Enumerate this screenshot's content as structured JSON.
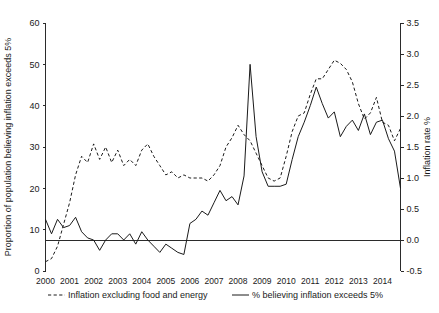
{
  "chart_data": {
    "type": "line",
    "title": "",
    "xlabel": "",
    "ylabel": "Proportion of population believing inflation exceeds 5%",
    "y2label": "Inflation rate %",
    "xlim": [
      2000.0,
      2014.75
    ],
    "ylim": [
      0,
      60
    ],
    "y2lim": [
      -0.5,
      3.5
    ],
    "grid": false,
    "legend_position": "below",
    "x_tick_labels": [
      "2000",
      "2001",
      "2002",
      "2003",
      "2004",
      "2005",
      "2006",
      "2007",
      "2008",
      "2009",
      "2010",
      "2011",
      "2012",
      "2013",
      "2014"
    ],
    "x_tick_values": [
      2000,
      2001,
      2002,
      2003,
      2004,
      2005,
      2006,
      2007,
      2008,
      2009,
      2010,
      2011,
      2012,
      2013,
      2014
    ],
    "y_tick_labels": [
      "0",
      "10",
      "20",
      "30",
      "40",
      "50",
      "60"
    ],
    "y_tick_values": [
      0,
      10,
      20,
      30,
      40,
      50,
      60
    ],
    "y2_tick_labels": [
      "-0.5",
      "0.0",
      "0.5",
      "1.0",
      "1.5",
      "2.0",
      "2.5",
      "3.0",
      "3.5"
    ],
    "y2_tick_values": [
      -0.5,
      0.0,
      0.5,
      1.0,
      1.5,
      2.0,
      2.5,
      3.0,
      3.5
    ],
    "series": [
      {
        "name": "Inflation excluding food and energy",
        "style": "dashed",
        "axis": "right",
        "x": [
          2000.0,
          2000.25,
          2000.5,
          2000.75,
          2001.0,
          2001.25,
          2001.5,
          2001.75,
          2002.0,
          2002.25,
          2002.5,
          2002.75,
          2003.0,
          2003.25,
          2003.5,
          2003.75,
          2004.0,
          2004.25,
          2004.5,
          2004.75,
          2005.0,
          2005.25,
          2005.5,
          2005.75,
          2006.0,
          2006.25,
          2006.5,
          2006.75,
          2007.0,
          2007.25,
          2007.5,
          2007.75,
          2008.0,
          2008.25,
          2008.5,
          2008.75,
          2009.0,
          2009.25,
          2009.5,
          2009.75,
          2010.0,
          2010.25,
          2010.5,
          2010.75,
          2011.0,
          2011.25,
          2011.5,
          2011.75,
          2012.0,
          2012.25,
          2012.5,
          2012.75,
          2013.0,
          2013.25,
          2013.5,
          2013.75,
          2014.0,
          2014.25,
          2014.5,
          2014.75
        ],
        "values": [
          -0.35,
          -0.3,
          -0.1,
          0.25,
          0.6,
          1.05,
          1.35,
          1.25,
          1.55,
          1.3,
          1.5,
          1.25,
          1.45,
          1.2,
          1.3,
          1.2,
          1.45,
          1.55,
          1.35,
          1.2,
          1.05,
          1.1,
          1.0,
          1.05,
          1.0,
          1.0,
          1.0,
          0.95,
          1.05,
          1.2,
          1.5,
          1.65,
          1.85,
          1.7,
          1.6,
          1.4,
          1.2,
          1.0,
          0.95,
          1.0,
          1.35,
          1.75,
          2.0,
          2.05,
          2.35,
          2.6,
          2.6,
          2.75,
          2.9,
          2.85,
          2.75,
          2.55,
          2.2,
          1.95,
          2.05,
          2.3,
          1.9,
          1.85,
          1.6,
          1.8
        ],
        "annotations": []
      },
      {
        "name": "% believing inflation exceeds 5%",
        "style": "solid",
        "axis": "left",
        "x": [
          2000.0,
          2000.25,
          2000.5,
          2000.75,
          2001.0,
          2001.25,
          2001.5,
          2001.75,
          2002.0,
          2002.25,
          2002.5,
          2002.75,
          2003.0,
          2003.25,
          2003.5,
          2003.75,
          2004.0,
          2004.25,
          2004.5,
          2004.75,
          2005.0,
          2005.25,
          2005.5,
          2005.75,
          2006.0,
          2006.25,
          2006.5,
          2006.75,
          2007.0,
          2007.25,
          2007.5,
          2007.75,
          2008.0,
          2008.25,
          2008.5,
          2008.75,
          2009.0,
          2009.25,
          2009.5,
          2009.75,
          2010.0,
          2010.25,
          2010.5,
          2010.75,
          2011.0,
          2011.25,
          2011.5,
          2011.75,
          2012.0,
          2012.25,
          2012.5,
          2012.75,
          2013.0,
          2013.25,
          2013.5,
          2013.75,
          2014.0,
          2014.25,
          2014.5,
          2014.75
        ],
        "values": [
          12.5,
          9.0,
          12.5,
          10.5,
          11.0,
          13.0,
          9.5,
          8.0,
          7.5,
          5.0,
          7.5,
          9.0,
          9.0,
          7.5,
          9.0,
          6.5,
          9.5,
          7.5,
          6.0,
          4.5,
          6.5,
          5.5,
          4.5,
          4.0,
          11.5,
          12.5,
          14.5,
          13.5,
          16.5,
          19.5,
          17.0,
          18.0,
          16.0,
          23.0,
          50.0,
          32.5,
          24.0,
          20.5,
          20.5,
          20.5,
          21.0,
          27.0,
          32.5,
          36.0,
          40.0,
          44.5,
          40.5,
          37.0,
          38.5,
          32.5,
          35.0,
          36.5,
          34.0,
          38.0,
          33.0,
          36.0,
          36.5,
          32.0,
          29.0,
          20.0
        ],
        "annotations": []
      }
    ]
  },
  "legend": {
    "items": [
      {
        "label": "Inflation excluding food and energy",
        "style": "dashed"
      },
      {
        "label": "% believing inflation exceeds 5%",
        "style": "solid"
      }
    ]
  }
}
